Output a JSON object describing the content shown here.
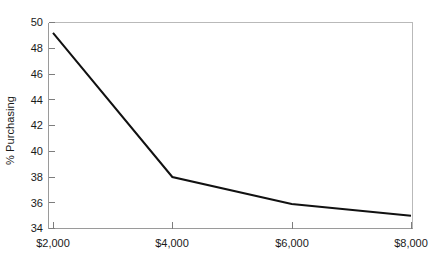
{
  "chart_data": {
    "type": "line",
    "title": "",
    "subtitle": "",
    "xlabel": "",
    "ylabel": "% Purchasing",
    "x": [
      2000,
      4000,
      6000,
      8000
    ],
    "categories": [
      "$2,000",
      "$4,000",
      "$6,000",
      "$8,000"
    ],
    "values": [
      49.2,
      38.0,
      35.9,
      35.0
    ],
    "series": [
      {
        "name": "% Purchasing",
        "values": [
          49.2,
          38.0,
          35.9,
          35.0
        ]
      }
    ],
    "xlim": [
      2000,
      8000
    ],
    "ylim": [
      34,
      50
    ],
    "y_ticks": [
      34,
      36,
      38,
      40,
      42,
      44,
      46,
      48,
      50
    ],
    "y_tick_labels": [
      "34",
      "36",
      "38",
      "40",
      "42",
      "44",
      "46",
      "48",
      "50"
    ],
    "x_ticks": [
      2000,
      4000,
      6000,
      8000
    ],
    "x_tick_labels": [
      "$2,000",
      "$4,000",
      "$6,000",
      "$8,000"
    ],
    "grid": false,
    "legend": false,
    "legend_position": "none",
    "annotations": [],
    "line_color": "#111111",
    "axis_color": "#9a9a9a",
    "frame_color": "#b9b9b9",
    "background_color": "#ffffff"
  }
}
